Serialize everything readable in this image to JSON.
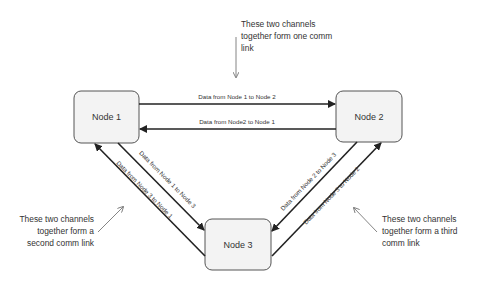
{
  "nodes": [
    {
      "id": "node1",
      "label": "Node 1"
    },
    {
      "id": "node2",
      "label": "Node 2"
    },
    {
      "id": "node3",
      "label": "Node 3"
    }
  ],
  "channels": [
    {
      "from": "node1",
      "to": "node2",
      "label": "Data from Node 1 to Node 2"
    },
    {
      "from": "node2",
      "to": "node1",
      "label": "Data from Node2 to Node 1"
    },
    {
      "from": "node1",
      "to": "node3",
      "label": "Data from Node 1 to Node 3"
    },
    {
      "from": "node3",
      "to": "node1",
      "label": "Data from Node 3 to Node 1"
    },
    {
      "from": "node2",
      "to": "node3",
      "label": "Data from Node 2 to Node 3"
    },
    {
      "from": "node3",
      "to": "node2",
      "label": "Data from Node 3 to Node 2"
    }
  ],
  "annotations": {
    "top": [
      "These two channels",
      "together form one comm",
      "link"
    ],
    "left": [
      "These two channels",
      "together form a",
      "second comm link"
    ],
    "right": [
      "These two channels",
      "together form a third",
      "comm link"
    ]
  },
  "colors": {
    "node_fill": "#f3f3f3",
    "node_stroke": "#555555",
    "arrow": "#222222",
    "pointer": "#777777"
  }
}
